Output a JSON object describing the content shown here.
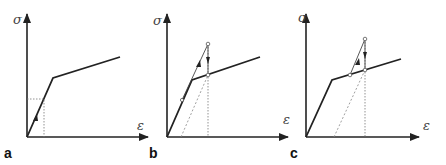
{
  "figure": {
    "panels": [
      {
        "label": "a",
        "y_axis_label": "σ",
        "x_axis_label": "ε"
      },
      {
        "label": "b",
        "y_axis_label": "σ",
        "x_axis_label": "ε"
      },
      {
        "label": "c",
        "y_axis_label": "σ",
        "x_axis_label": "ε"
      }
    ],
    "colors": {
      "curve": "#222222",
      "axis": "#222222",
      "guide": "#777777"
    }
  }
}
